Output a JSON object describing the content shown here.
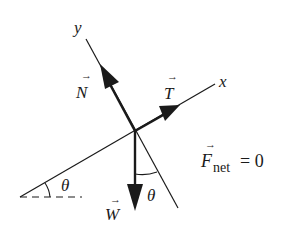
{
  "diagram": {
    "type": "free-body-diagram",
    "colors": {
      "ink": "#1a1a1a",
      "background": "#ffffff"
    },
    "axes": {
      "x_label": "x",
      "y_label": "y"
    },
    "forces": [
      {
        "id": "N",
        "label": "N",
        "direction": "along +y (perpendicular to incline)"
      },
      {
        "id": "T",
        "label": "T",
        "direction": "along +x (up the incline)"
      },
      {
        "id": "W",
        "label": "W",
        "direction": "straight down"
      }
    ],
    "angles": [
      {
        "label": "θ",
        "location": "between incline and horizontal"
      },
      {
        "label": "θ",
        "location": "between weight and −y axis"
      }
    ],
    "equation": {
      "symbol": "F",
      "subscript": "net",
      "rhs": "= 0"
    }
  }
}
